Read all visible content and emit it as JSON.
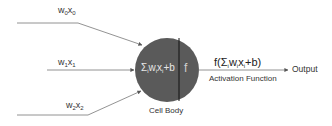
{
  "diagram": {
    "type": "neuron",
    "inputs": [
      {
        "w": "w",
        "w_sub": "0",
        "x": "x",
        "x_sub": "0"
      },
      {
        "w": "w",
        "w_sub": "1",
        "x": "x",
        "x_sub": "1"
      },
      {
        "w": "w",
        "w_sub": "2",
        "x": "x",
        "x_sub": "2"
      }
    ],
    "cell_body": {
      "sum_symbol": "Σ",
      "sum_sub": "i",
      "sum_expr_w": "w",
      "sum_expr_w_sub": "i",
      "sum_expr_x": "x",
      "sum_expr_x_sub": "i",
      "sum_expr_tail": "+b",
      "activation_symbol": "f",
      "label": "Cell Body",
      "fill_color": "#5a5a5a"
    },
    "activation": {
      "expr_prefix": "f(Σ",
      "expr_sub": "i",
      "expr_w": "w",
      "expr_w_sub": "i",
      "expr_x": "x",
      "expr_x_sub": "i",
      "expr_suffix": "+b)",
      "label": "Activation Function"
    },
    "output_label": "Output",
    "line_color": "#555555"
  }
}
